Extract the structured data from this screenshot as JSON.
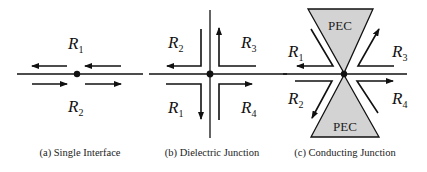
{
  "figure": {
    "panels": [
      {
        "id": "a",
        "caption": "(a) Single Interface",
        "labels": [
          {
            "base": "R",
            "sub": "1"
          },
          {
            "base": "R",
            "sub": "2"
          }
        ]
      },
      {
        "id": "b",
        "caption": "(b) Dielectric Junction",
        "labels": [
          {
            "base": "R",
            "sub": "2"
          },
          {
            "base": "R",
            "sub": "3"
          },
          {
            "base": "R",
            "sub": "1"
          },
          {
            "base": "R",
            "sub": "4"
          }
        ]
      },
      {
        "id": "c",
        "caption": "(c) Conducting Junction",
        "conductor_label_top": "PEC",
        "conductor_label_bottom": "PEC",
        "labels": [
          {
            "base": "R",
            "sub": "1"
          },
          {
            "base": "R",
            "sub": "3"
          },
          {
            "base": "R",
            "sub": "2"
          },
          {
            "base": "R",
            "sub": "4"
          }
        ]
      }
    ],
    "colors": {
      "line": "#111111",
      "pec_fill": "#d3d3d3",
      "background": "#ffffff"
    }
  }
}
